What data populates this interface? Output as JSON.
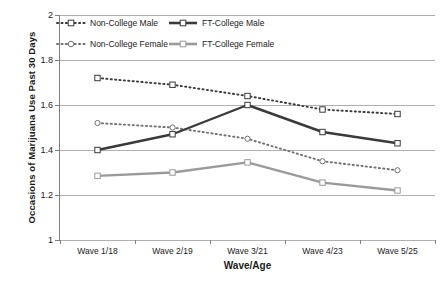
{
  "chart_data": {
    "type": "line",
    "title": "",
    "xlabel": "Wave/Age",
    "ylabel": "Occasions of Marijuana Use Past 30 Days",
    "categories": [
      "Wave 1/18",
      "Wave 2/19",
      "Wave 3/21",
      "Wave 4/23",
      "Wave 5/25"
    ],
    "ylim": [
      1,
      2
    ],
    "yticks": [
      "1",
      "1.2",
      "1.4",
      "1.6",
      "1.8",
      "2"
    ],
    "ytick_values": [
      1,
      1.2,
      1.4,
      1.6,
      1.8,
      2
    ],
    "grid": true,
    "legend_position": "top-inside",
    "series": [
      {
        "name": "Non-College Male",
        "values": [
          1.72,
          1.69,
          1.64,
          1.58,
          1.56
        ],
        "color": "#3a3a3a",
        "style": "dotted",
        "marker": "square-open"
      },
      {
        "name": "FT-College Male",
        "values": [
          1.4,
          1.47,
          1.6,
          1.48,
          1.43
        ],
        "color": "#3a3a3a",
        "style": "solid",
        "marker": "square-open"
      },
      {
        "name": "Non-College Female",
        "values": [
          1.52,
          1.5,
          1.45,
          1.35,
          1.31
        ],
        "color": "#707070",
        "style": "dotted",
        "marker": "circle-open"
      },
      {
        "name": "FT-College Female",
        "values": [
          1.285,
          1.3,
          1.345,
          1.255,
          1.22
        ],
        "color": "#9a9a9a",
        "style": "solid",
        "marker": "square-open"
      }
    ]
  },
  "legend": {
    "entries": [
      {
        "label": "Non-College Male"
      },
      {
        "label": "FT-College Male"
      },
      {
        "label": "Non-College Female"
      },
      {
        "label": "FT-College Female"
      }
    ]
  },
  "axes": {
    "x_title": "Wave/Age",
    "y_title": "Occasions of Marijuana Use Past 30 Days"
  }
}
